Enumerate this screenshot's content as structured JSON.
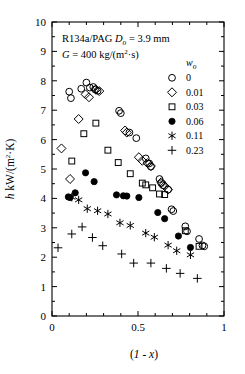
{
  "chart_data": {
    "type": "scatter",
    "title": "",
    "xlabel": "(1 - x)",
    "ylabel": "h   kW/(m²·K)",
    "xlim": [
      0,
      1
    ],
    "ylim": [
      0,
      10
    ],
    "xticks": [
      0,
      0.5,
      1
    ],
    "xticklabels": [
      "0",
      "0.5",
      "1"
    ],
    "xminor_step": 0.1,
    "yticks": [
      0,
      1,
      2,
      3,
      4,
      5,
      6,
      7,
      8,
      9,
      10
    ],
    "yticklabels": [
      "0",
      "1",
      "2",
      "3",
      "4",
      "5",
      "6",
      "7",
      "8",
      "9",
      "10"
    ],
    "grid": false,
    "legend_position": "upper-right inside",
    "legend_title": "w_o",
    "annotations": [
      "R134a/PAG   D_o = 3.9 mm",
      "G = 400 kg/(m²·s)"
    ],
    "series": [
      {
        "name": "0",
        "w_o": 0,
        "marker": "open-circle",
        "points": [
          [
            0.1,
            7.63
          ],
          [
            0.11,
            7.41
          ],
          [
            0.17,
            7.73
          ],
          [
            0.2,
            7.94
          ],
          [
            0.22,
            7.77
          ],
          [
            0.24,
            7.79
          ],
          [
            0.25,
            7.71
          ],
          [
            0.265,
            7.66
          ],
          [
            0.39,
            6.98
          ],
          [
            0.4,
            6.9
          ],
          [
            0.45,
            6.24
          ],
          [
            0.49,
            6.05
          ],
          [
            0.545,
            5.36
          ],
          [
            0.565,
            5.19
          ],
          [
            0.575,
            5.08
          ],
          [
            0.625,
            4.66
          ],
          [
            0.635,
            4.52
          ],
          [
            0.645,
            4.45
          ],
          [
            0.675,
            4.3
          ],
          [
            0.695,
            3.63
          ],
          [
            0.705,
            3.57
          ],
          [
            0.775,
            3.05
          ],
          [
            0.785,
            2.88
          ],
          [
            0.855,
            2.62
          ],
          [
            0.875,
            2.4
          ],
          [
            0.885,
            2.37
          ]
        ]
      },
      {
        "name": "0.01",
        "w_o": 0.01,
        "marker": "open-diamond",
        "points": [
          [
            0.055,
            5.7
          ],
          [
            0.105,
            4.66
          ],
          [
            0.155,
            6.7
          ],
          [
            0.195,
            7.54
          ],
          [
            0.215,
            7.44
          ],
          [
            0.255,
            7.7
          ],
          [
            0.275,
            7.65
          ],
          [
            0.425,
            6.31
          ],
          [
            0.435,
            6.24
          ],
          [
            0.505,
            5.4
          ],
          [
            0.525,
            5.28
          ],
          [
            0.555,
            5.2
          ],
          [
            0.575,
            5.1
          ],
          [
            0.635,
            4.55
          ],
          [
            0.655,
            4.42
          ],
          [
            0.675,
            4.3
          ]
        ]
      },
      {
        "name": "0.03",
        "w_o": 0.03,
        "marker": "open-square",
        "points": [
          [
            0.115,
            5.27
          ],
          [
            0.185,
            6.2
          ],
          [
            0.255,
            6.56
          ],
          [
            0.325,
            5.64
          ],
          [
            0.385,
            5.22
          ],
          [
            0.455,
            4.84
          ],
          [
            0.525,
            4.52
          ],
          [
            0.545,
            4.46
          ],
          [
            0.585,
            4.36
          ],
          [
            0.625,
            4.15
          ],
          [
            0.655,
            4.13
          ],
          [
            0.775,
            2.9
          ],
          [
            0.855,
            2.37
          ]
        ]
      },
      {
        "name": "0.06",
        "w_o": 0.06,
        "marker": "filled-circle",
        "points": [
          [
            0.095,
            4.05
          ],
          [
            0.105,
            4.03
          ],
          [
            0.135,
            4.19
          ],
          [
            0.195,
            4.87
          ],
          [
            0.245,
            4.57
          ],
          [
            0.375,
            4.12
          ],
          [
            0.415,
            4.09
          ],
          [
            0.435,
            4.08
          ],
          [
            0.505,
            4.03
          ],
          [
            0.615,
            3.52
          ],
          [
            0.655,
            3.31
          ],
          [
            0.735,
            2.72
          ],
          [
            0.805,
            2.33
          ]
        ]
      },
      {
        "name": "0.11",
        "w_o": 0.11,
        "marker": "asterisk",
        "points": [
          [
            0.115,
            4.04
          ],
          [
            0.155,
            3.95
          ],
          [
            0.205,
            3.65
          ],
          [
            0.265,
            3.58
          ],
          [
            0.325,
            3.47
          ],
          [
            0.395,
            3.17
          ],
          [
            0.455,
            3.08
          ],
          [
            0.545,
            2.82
          ],
          [
            0.595,
            2.68
          ],
          [
            0.675,
            2.41
          ],
          [
            0.725,
            2.22
          ],
          [
            0.805,
            2.08
          ]
        ]
      },
      {
        "name": "0.23",
        "w_o": 0.23,
        "marker": "plus",
        "points": [
          [
            0.035,
            2.32
          ],
          [
            0.115,
            2.79
          ],
          [
            0.175,
            3.03
          ],
          [
            0.235,
            2.67
          ],
          [
            0.295,
            2.39
          ],
          [
            0.405,
            2.11
          ],
          [
            0.475,
            1.8
          ],
          [
            0.575,
            1.8
          ],
          [
            0.665,
            1.62
          ],
          [
            0.745,
            1.45
          ],
          [
            0.845,
            1.28
          ]
        ]
      }
    ]
  },
  "axes": {
    "y_label_main": "kW/(m",
    "y_label_sup": "2",
    "y_label_tail": "·K)",
    "y_label_h": "h",
    "x_label_open": "(",
    "x_label_one": "1",
    "x_label_dash": " - ",
    "x_label_x": "x",
    "x_label_close": ")",
    "ytick_0": "0",
    "ytick_1": "1",
    "ytick_2": "2",
    "ytick_3": "3",
    "ytick_4": "4",
    "ytick_5": "5",
    "ytick_6": "6",
    "ytick_7": "7",
    "ytick_8": "8",
    "ytick_9": "9",
    "ytick_10": "10",
    "xtick_0": "0",
    "xtick_half": "0.5",
    "xtick_1": "1"
  },
  "annotations": {
    "line1_fluid": "R134a/PAG",
    "line1_diam_sym": "D",
    "line1_diam_sub": "o",
    "line1_diam_val": " = 3.9 mm",
    "line2_g_sym": "G",
    "line2_g_val": " = 400 kg/(m",
    "line2_g_sup": "2",
    "line2_g_tail": "·s)"
  },
  "legend": {
    "title_sym": "w",
    "title_sub": "o",
    "entries": [
      {
        "label": "0",
        "marker": "open-circle"
      },
      {
        "label": "0.01",
        "marker": "open-diamond"
      },
      {
        "label": "0.03",
        "marker": "open-square"
      },
      {
        "label": "0.06",
        "marker": "filled-circle"
      },
      {
        "label": "0.11",
        "marker": "asterisk"
      },
      {
        "label": "0.23",
        "marker": "plus"
      }
    ]
  },
  "colors": {
    "ink": "#000000",
    "background": "#ffffff"
  }
}
